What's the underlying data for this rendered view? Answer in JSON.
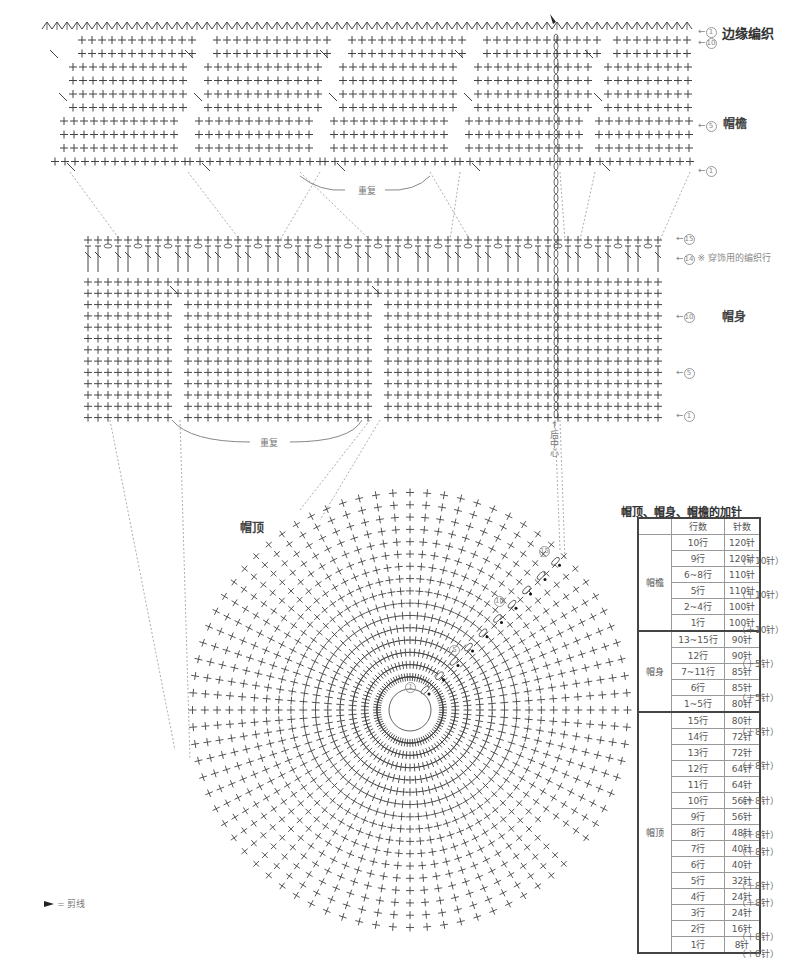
{
  "labels": {
    "edging": "边缘编织",
    "brim": "帽檐",
    "body": "帽身",
    "crown": "帽顶",
    "repeat": "重复",
    "drawstring_row_note": "※ 穿饰用的编织行",
    "back_center": "后中心",
    "legend_cut": "= 剪线"
  },
  "row_markers": {
    "brim": [
      {
        "id": "edging-row",
        "num": "1",
        "arrow": "←"
      },
      {
        "id": "brim-row-10",
        "num": "10",
        "arrow": "←"
      },
      {
        "id": "brim-row-5",
        "num": "5",
        "arrow": "←"
      },
      {
        "id": "brim-row-1",
        "num": "1",
        "arrow": "←"
      }
    ],
    "body": [
      {
        "id": "body-row-15",
        "num": "15",
        "arrow": "←"
      },
      {
        "id": "body-row-14",
        "num": "14",
        "arrow": "←"
      },
      {
        "id": "body-row-10",
        "num": "10",
        "arrow": "←"
      },
      {
        "id": "body-row-5",
        "num": "5",
        "arrow": "←"
      },
      {
        "id": "body-row-1",
        "num": "1",
        "arrow": "←"
      }
    ],
    "crown": [
      "1",
      "5",
      "10",
      "15"
    ]
  },
  "table": {
    "title": "帽顶、帽身、帽檐的加针",
    "headers": [
      "",
      "行数",
      "针数"
    ],
    "groups": [
      {
        "name": "帽檐",
        "rows": [
          {
            "row": "10行",
            "stitches": "120针",
            "inc": ""
          },
          {
            "row": "9行",
            "stitches": "120针",
            "inc": "（＋10针）"
          },
          {
            "row": "6~8行",
            "stitches": "110针",
            "inc": ""
          },
          {
            "row": "5行",
            "stitches": "110针",
            "inc": "（＋10针）"
          },
          {
            "row": "2~4行",
            "stitches": "100针",
            "inc": ""
          },
          {
            "row": "1行",
            "stitches": "100针",
            "inc": "（＋10针）"
          }
        ]
      },
      {
        "name": "帽身",
        "rows": [
          {
            "row": "13~15行",
            "stitches": "90针",
            "inc": ""
          },
          {
            "row": "12行",
            "stitches": "90针",
            "inc": "（＋5针）"
          },
          {
            "row": "7~11行",
            "stitches": "85针",
            "inc": ""
          },
          {
            "row": "6行",
            "stitches": "85针",
            "inc": "（＋5针）"
          },
          {
            "row": "1~5行",
            "stitches": "80针",
            "inc": ""
          }
        ]
      },
      {
        "name": "帽顶",
        "rows": [
          {
            "row": "15行",
            "stitches": "80针",
            "inc": "（＋8针）"
          },
          {
            "row": "14行",
            "stitches": "72针",
            "inc": ""
          },
          {
            "row": "13行",
            "stitches": "72针",
            "inc": "（＋8针）"
          },
          {
            "row": "12行",
            "stitches": "64针",
            "inc": ""
          },
          {
            "row": "11行",
            "stitches": "64针",
            "inc": "（＋8针）"
          },
          {
            "row": "10行",
            "stitches": "56针",
            "inc": ""
          },
          {
            "row": "9行",
            "stitches": "56针",
            "inc": "（＋8针）"
          },
          {
            "row": "8行",
            "stitches": "48针",
            "inc": "（＋8针）"
          },
          {
            "row": "7行",
            "stitches": "40针",
            "inc": ""
          },
          {
            "row": "6行",
            "stitches": "40针",
            "inc": "（＋8针）"
          },
          {
            "row": "5行",
            "stitches": "32针",
            "inc": "（＋8针）"
          },
          {
            "row": "4行",
            "stitches": "24针",
            "inc": ""
          },
          {
            "row": "3行",
            "stitches": "24针",
            "inc": "（＋8针）"
          },
          {
            "row": "2行",
            "stitches": "16针",
            "inc": "（＋8针）"
          },
          {
            "row": "1行",
            "stitches": "8针",
            "inc": ""
          }
        ]
      }
    ]
  },
  "colors": {
    "stitch": "#444444",
    "dashed": "#999999",
    "text": "#333333",
    "table_border": "#444444"
  }
}
